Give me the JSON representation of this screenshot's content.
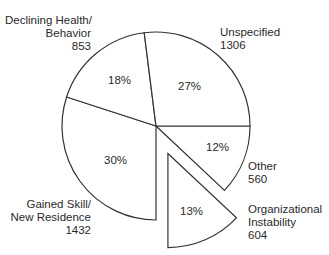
{
  "chart_data": {
    "type": "pie",
    "title": "",
    "start_angle_deg_clockwise_from_3oclock": 0,
    "exploded": [
      "Organizational Instability"
    ],
    "slices": [
      {
        "label": "Other",
        "count": 560,
        "percent": 12,
        "pct_label": "12%"
      },
      {
        "label": "Organizational Instability",
        "count": 604,
        "percent": 13,
        "pct_label": "13%"
      },
      {
        "label": "Gained Skill/ New Residence",
        "count": 1432,
        "percent": 30,
        "pct_label": "30%"
      },
      {
        "label": "Declining Health/ Behavior",
        "count": 853,
        "percent": 18,
        "pct_label": "18%"
      },
      {
        "label": "Unspecified",
        "count": 1306,
        "percent": 27,
        "pct_label": "27%"
      }
    ]
  },
  "labels": {
    "declining": {
      "line1": "Declining Health/",
      "line2": "Behavior",
      "count": "853",
      "pct": "18%"
    },
    "unspecified": {
      "line1": "Unspecified",
      "count": "1306",
      "pct": "27%"
    },
    "gained": {
      "line1": "Gained Skill/",
      "line2": "New Residence",
      "count": "1432",
      "pct": "30%"
    },
    "other": {
      "line1": "Other",
      "count": "560",
      "pct": "12%"
    },
    "organizational": {
      "line1": "Organizational",
      "line2": "Instability",
      "count": "604",
      "pct": "13%"
    }
  },
  "style": {
    "stroke": "#333333",
    "fill": "#ffffff"
  }
}
